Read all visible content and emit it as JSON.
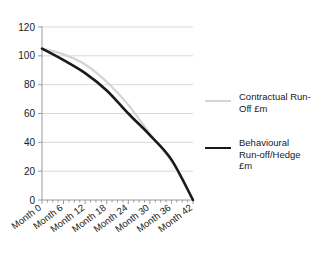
{
  "chart_data": {
    "type": "line",
    "title": "",
    "xlabel": "",
    "ylabel": "",
    "x": [
      "Month 0",
      "Month 6",
      "Month 12",
      "Month 18",
      "Month 24",
      "Month 30",
      "Month 36",
      "Month 42"
    ],
    "x_values": [
      0,
      6,
      12,
      18,
      24,
      30,
      36,
      42
    ],
    "xlim": [
      0,
      42
    ],
    "ylim": [
      0,
      120
    ],
    "yticks": [
      0,
      20,
      40,
      60,
      80,
      100,
      120
    ],
    "ytick_labels": [
      "0",
      "20",
      "40",
      "60",
      "80",
      "100",
      "120"
    ],
    "grid": "horizontal",
    "legend_position": "right",
    "minor_xticks_interval": 1.5,
    "series": [
      {
        "name": "Contractual Run-Off £m",
        "color": "#d4d4d4",
        "width": 2.2,
        "values": [
          105,
          101,
          94,
          82,
          66,
          46,
          27,
          0
        ]
      },
      {
        "name": "Behavioural Run-off/Hedge £m",
        "color": "#1a1a1a",
        "width": 2.6,
        "values": [
          105,
          97,
          88,
          76,
          60,
          45,
          28,
          0
        ]
      }
    ]
  },
  "legend": {
    "items": [
      {
        "label_line1": "Contractual Run-",
        "label_line2": "Off £m",
        "label_line3": "",
        "color": "#d4d4d4"
      },
      {
        "label_line1": "Behavioural",
        "label_line2": "Run-off/Hedge",
        "label_line3": "£m",
        "color": "#1a1a1a"
      }
    ]
  },
  "axis": {
    "axis_color": "#9a9a9a",
    "grid_color": "#d9d9d9"
  }
}
